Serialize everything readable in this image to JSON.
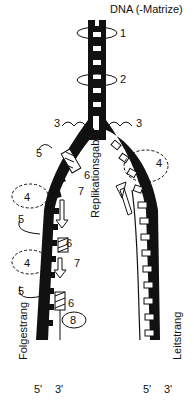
{
  "diagram": {
    "title_label": "DNA (-Matrize)",
    "fork_label": "Replikationsgabel",
    "lagging_label": "Folgestrang",
    "leading_label": "Leitstrang",
    "end_labels": {
      "left_5": "5'",
      "left_3": "3'",
      "right_5": "5'",
      "right_3": "3'"
    },
    "numbers": {
      "n1": "1",
      "n2": "2",
      "n3_left": "3",
      "n3_right": "3",
      "n4_right": "4",
      "n4_left_a": "4",
      "n4_left_b": "4",
      "n5_a": "5",
      "n5_b": "5",
      "n5_c": "5",
      "n6_a": "6",
      "n6_b": "6",
      "n6_c": "6",
      "n7_a": "7",
      "n7_b": "7",
      "n8": "8"
    },
    "colors": {
      "strand": "#111111",
      "background": "#ffffff"
    }
  }
}
